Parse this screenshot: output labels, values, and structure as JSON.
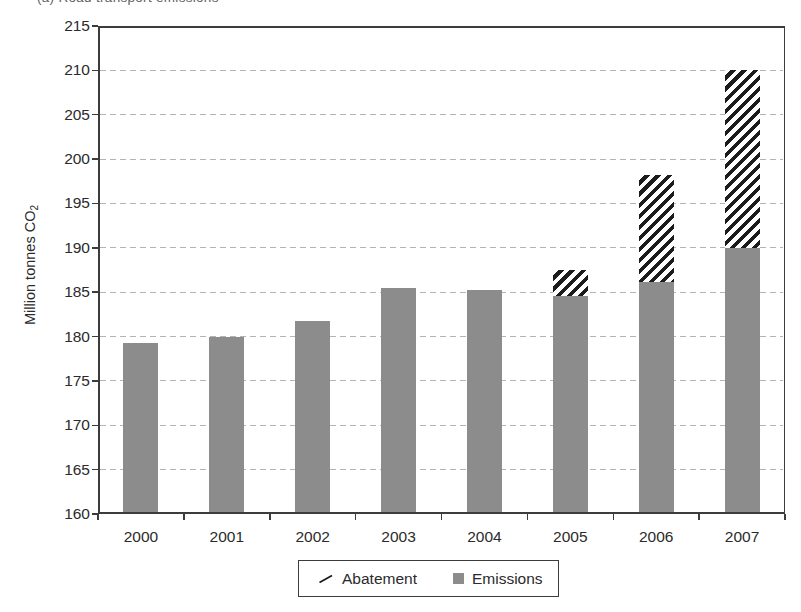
{
  "caption": "(a) Road transport emissions",
  "labels": {
    "y_axis_main": "Million tonnes CO",
    "y_axis_sub": "2"
  },
  "legend": {
    "abatement": "Abatement",
    "emissions": "Emissions"
  },
  "colors": {
    "bar_gray": "#8c8c8c",
    "hatch_black": "#1c1c1c",
    "axis": "#3c3c3c",
    "gridline": "#b4b4b4"
  },
  "chart_data": {
    "type": "bar",
    "stacked": true,
    "categories": [
      "2000",
      "2001",
      "2002",
      "2003",
      "2004",
      "2005",
      "2006",
      "2007"
    ],
    "series": [
      {
        "name": "Emissions",
        "style": "solid-gray",
        "values": [
          179.3,
          179.9,
          181.8,
          185.5,
          185.2,
          184.6,
          186.1,
          190.0
        ]
      },
      {
        "name": "Abatement",
        "style": "diagonal-hatch",
        "values": [
          0,
          0,
          0,
          0,
          0,
          2.9,
          12.1,
          20.1
        ]
      }
    ],
    "title": "",
    "xlabel": "",
    "ylabel": "Million tonnes CO2",
    "ylim": [
      160,
      215
    ],
    "ytick_step": 5,
    "grid": "horizontal-dashed",
    "legend_position": "bottom-center",
    "legend_order": [
      "Abatement",
      "Emissions"
    ]
  }
}
